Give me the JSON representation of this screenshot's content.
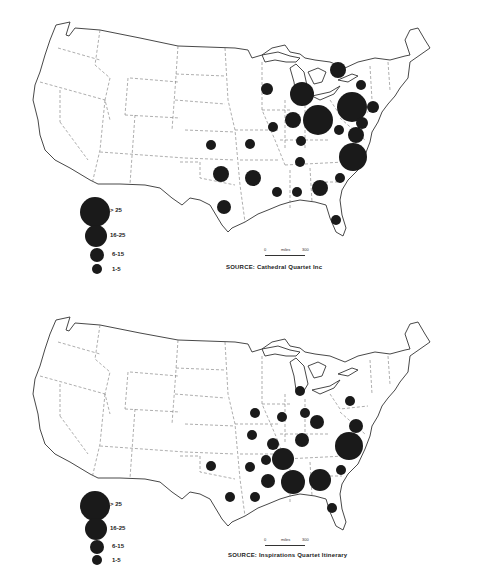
{
  "maps": [
    {
      "id": "top",
      "source_label": "SOURCE:",
      "source_text": "Cathedral Quartet Inc",
      "scale": {
        "start": "0",
        "unit": "miles",
        "end": "300"
      },
      "legend": [
        {
          "label": "> 25",
          "r": 15
        },
        {
          "label": "16-25",
          "r": 11
        },
        {
          "label": "6-15",
          "r": 7
        },
        {
          "label": "1-5",
          "r": 5
        }
      ],
      "bubbles": [
        {
          "x": 338,
          "y": 70,
          "r": 8
        },
        {
          "x": 361,
          "y": 85,
          "r": 5
        },
        {
          "x": 267,
          "y": 89,
          "r": 6
        },
        {
          "x": 302,
          "y": 94,
          "r": 12
        },
        {
          "x": 352,
          "y": 107,
          "r": 15
        },
        {
          "x": 373,
          "y": 107,
          "r": 6
        },
        {
          "x": 293,
          "y": 120,
          "r": 8
        },
        {
          "x": 318,
          "y": 120,
          "r": 15
        },
        {
          "x": 362,
          "y": 123,
          "r": 6
        },
        {
          "x": 339,
          "y": 130,
          "r": 5
        },
        {
          "x": 356,
          "y": 135,
          "r": 8
        },
        {
          "x": 273,
          "y": 127,
          "r": 5
        },
        {
          "x": 211,
          "y": 145,
          "r": 5
        },
        {
          "x": 250,
          "y": 144,
          "r": 5
        },
        {
          "x": 301,
          "y": 141,
          "r": 5
        },
        {
          "x": 353,
          "y": 157,
          "r": 14
        },
        {
          "x": 300,
          "y": 162,
          "r": 5
        },
        {
          "x": 221,
          "y": 174,
          "r": 8
        },
        {
          "x": 253,
          "y": 178,
          "r": 8
        },
        {
          "x": 277,
          "y": 192,
          "r": 5
        },
        {
          "x": 297,
          "y": 192,
          "r": 5
        },
        {
          "x": 320,
          "y": 188,
          "r": 8
        },
        {
          "x": 340,
          "y": 178,
          "r": 5
        },
        {
          "x": 224,
          "y": 207,
          "r": 7
        },
        {
          "x": 336,
          "y": 220,
          "r": 5
        }
      ]
    },
    {
      "id": "bottom",
      "source_label": "SOURCE:",
      "source_text": "Inspirations Quartet Itinerary",
      "scale": {
        "start": "0",
        "unit": "miles",
        "end": "300"
      },
      "legend": [
        {
          "label": "> 25",
          "r": 15
        },
        {
          "label": "16-25",
          "r": 11
        },
        {
          "label": "6-15",
          "r": 7
        },
        {
          "label": "1-5",
          "r": 5
        }
      ],
      "bubbles": [
        {
          "x": 300,
          "y": 101,
          "r": 5
        },
        {
          "x": 350,
          "y": 111,
          "r": 5
        },
        {
          "x": 282,
          "y": 127,
          "r": 5
        },
        {
          "x": 255,
          "y": 123,
          "r": 5
        },
        {
          "x": 305,
          "y": 123,
          "r": 5
        },
        {
          "x": 317,
          "y": 132,
          "r": 7
        },
        {
          "x": 356,
          "y": 136,
          "r": 7
        },
        {
          "x": 252,
          "y": 145,
          "r": 5
        },
        {
          "x": 302,
          "y": 150,
          "r": 7
        },
        {
          "x": 349,
          "y": 156,
          "r": 14
        },
        {
          "x": 273,
          "y": 154,
          "r": 6
        },
        {
          "x": 283,
          "y": 169,
          "r": 11
        },
        {
          "x": 250,
          "y": 177,
          "r": 5
        },
        {
          "x": 268,
          "y": 191,
          "r": 7
        },
        {
          "x": 293,
          "y": 192,
          "r": 12
        },
        {
          "x": 320,
          "y": 190,
          "r": 11
        },
        {
          "x": 341,
          "y": 180,
          "r": 5
        },
        {
          "x": 211,
          "y": 176,
          "r": 5
        },
        {
          "x": 230,
          "y": 207,
          "r": 5
        },
        {
          "x": 255,
          "y": 207,
          "r": 5
        },
        {
          "x": 332,
          "y": 218,
          "r": 5
        },
        {
          "x": 266,
          "y": 170,
          "r": 5
        }
      ]
    }
  ],
  "colors": {
    "ink": "#1a1a1a",
    "outline": "#333333",
    "border_dash": "#666666",
    "background": "#ffffff"
  }
}
